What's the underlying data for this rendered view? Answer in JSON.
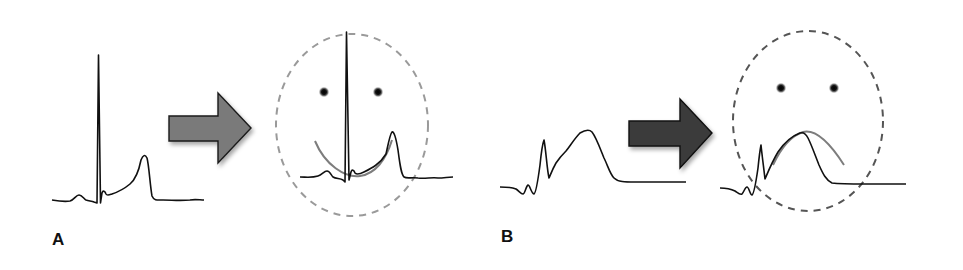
{
  "figure": {
    "panels": [
      {
        "label": "A",
        "description": "Normal ECG complex with tall R wave and upright T wave; concave ST segment forms a smiling face",
        "face": "smile",
        "arrow_color": "#7a7a7a",
        "face_outline_color": "#9a9a9a"
      },
      {
        "label": "B",
        "description": "ST elevation with convex (tombstone) ST segment forms a frowning face",
        "face": "frown",
        "arrow_color": "#3a3a3a",
        "face_outline_color": "#555555"
      }
    ],
    "colors": {
      "trace": "#111111",
      "mouth_curve": "#7d7d7d",
      "eye": "#1a1a1a",
      "background": "#ffffff"
    }
  }
}
